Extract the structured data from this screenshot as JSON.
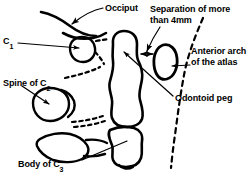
{
  "figure": {
    "ink_color": "#000000",
    "background_color": "#ffffff",
    "leader_color": "#000000",
    "labels": {
      "occiput": "Occiput",
      "c1": "C",
      "c1_sub": "1",
      "separation_line1": "Separation of more",
      "separation_line2": "than 4mm",
      "anterior_arch_line1": "Anterior arch",
      "anterior_arch_line2": "of the atlas",
      "odontoid": "Odontoid peg",
      "spine_c2": "Spine of  C",
      "spine_c2_sub": "2",
      "body_c3": "Body of C",
      "body_c3_sub": "3"
    },
    "annotations": {
      "measurement": "4mm",
      "dashed_line_meaning": "prevertebral soft tissue line",
      "gap_arrow": "double-headed arrow between odontoid peg and anterior arch"
    }
  }
}
